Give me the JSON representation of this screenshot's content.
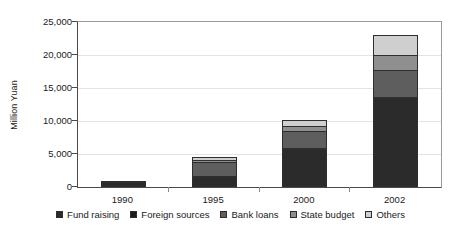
{
  "chart_data": {
    "type": "bar",
    "subtype": "stacked-bar",
    "title": "",
    "xlabel": "",
    "ylabel": "Million Yuan",
    "categories": [
      "1990",
      "1995",
      "2000",
      "2002"
    ],
    "ylim": [
      0,
      25000
    ],
    "yticks": [
      0,
      5000,
      10000,
      15000,
      20000,
      25000
    ],
    "ytick_labels": [
      "0",
      "5,000",
      "10,000",
      "15,000",
      "20,000",
      "25,000"
    ],
    "grid": true,
    "legend_position": "bottom",
    "series": [
      {
        "name": "Fund raising",
        "color": "#2b2b2b",
        "values": [
          700,
          1550,
          5750,
          13500
        ]
      },
      {
        "name": "Foreign sources",
        "color": "#1c1c1c",
        "values": [
          30,
          160,
          200,
          180
        ]
      },
      {
        "name": "Bank loans",
        "color": "#5e5e5e",
        "values": [
          40,
          2150,
          2550,
          4100
        ]
      },
      {
        "name": "State budget",
        "color": "#8f8f8f",
        "values": [
          30,
          260,
          700,
          2200
        ]
      },
      {
        "name": "Others",
        "color": "#cfcfcf",
        "values": [
          20,
          480,
          1000,
          3120
        ]
      }
    ],
    "totals": [
      820,
      4600,
      10200,
      23100
    ]
  },
  "axis": {
    "y_title": "Million Yuan"
  },
  "legend": {
    "entries": [
      {
        "label": "Fund raising"
      },
      {
        "label": "Foreign sources"
      },
      {
        "label": "Bank loans"
      },
      {
        "label": "State budget"
      },
      {
        "label": "Others"
      }
    ]
  }
}
